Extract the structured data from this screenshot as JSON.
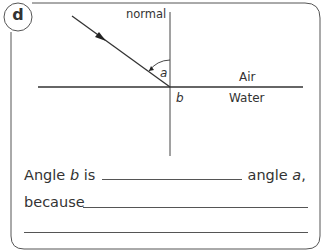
{
  "question": {
    "label": "d",
    "diagram": {
      "normal_label": "normal",
      "angle_a_label": "a",
      "angle_b_label": "b",
      "medium_top": "Air",
      "medium_bottom": "Water"
    },
    "sentence1": {
      "prefix": "Angle ",
      "var_b": "b",
      "mid": " is ",
      "suffix": " angle ",
      "var_a": "a",
      "end": ","
    },
    "sentence2": {
      "prefix": "because"
    }
  }
}
